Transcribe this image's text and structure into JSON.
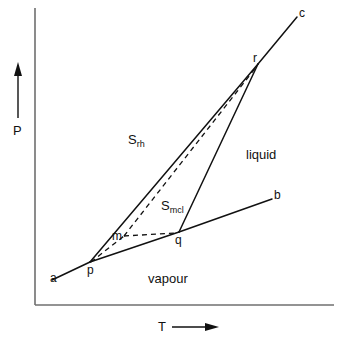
{
  "figure": {
    "background_color": "#ffffff",
    "line_color": "#111111",
    "axes": {
      "y_label": "P",
      "y_arrow": "up-arrow",
      "x_label": "T",
      "x_arrow": "right-arrow",
      "x_axis_name": "temperature-axis",
      "y_axis_name": "pressure-axis"
    }
  },
  "regions": [
    {
      "id": "s_rh",
      "label_main": "S",
      "label_sub": "rh",
      "x": 128,
      "y": 133
    },
    {
      "id": "s_mcl",
      "label_main": "S",
      "label_sub": "mcl",
      "x": 161,
      "y": 199
    },
    {
      "id": "liquid",
      "label_main": "liquid",
      "label_sub": "",
      "x": 246,
      "y": 148
    },
    {
      "id": "vapour",
      "label_main": "vapour",
      "label_sub": "",
      "x": 148,
      "y": 272
    }
  ],
  "points": [
    {
      "id": "a",
      "label": "a",
      "x": 52,
      "y": 280,
      "label_x": 50,
      "label_y": 272
    },
    {
      "id": "b",
      "label": "b",
      "x": 272,
      "y": 199,
      "label_x": 274,
      "label_y": 189
    },
    {
      "id": "c",
      "label": "c",
      "x": 297,
      "y": 17,
      "label_x": 299,
      "label_y": 7
    },
    {
      "id": "p",
      "label": "p",
      "x": 90,
      "y": 262,
      "label_x": 87,
      "label_y": 264
    },
    {
      "id": "q",
      "label": "q",
      "x": 179,
      "y": 232,
      "label_x": 175,
      "label_y": 234
    },
    {
      "id": "r",
      "label": "r",
      "x": 258,
      "y": 64,
      "label_x": 253,
      "label_y": 52
    },
    {
      "id": "m",
      "label": "m",
      "x": 118,
      "y": 233,
      "label_x": 112,
      "label_y": 230
    }
  ],
  "curves": [
    {
      "id": "sublimation-ap",
      "style": "solid",
      "from": "a",
      "to": "p"
    },
    {
      "id": "sublimation-pq",
      "style": "solid",
      "from": "p",
      "to": "q"
    },
    {
      "id": "vaporization-qb",
      "style": "solid",
      "from": "q",
      "to": "b"
    },
    {
      "id": "transition-pr",
      "style": "solid",
      "from": "p",
      "to": "r"
    },
    {
      "id": "fusion-qr",
      "style": "solid",
      "from": "q",
      "to": "r"
    },
    {
      "id": "fusion-rc",
      "style": "solid",
      "from": "r",
      "to": "c"
    },
    {
      "id": "metastable-pm",
      "style": "dashed",
      "from": "p",
      "to": "m"
    },
    {
      "id": "metastable-mq",
      "style": "dashed",
      "from": "m",
      "to": "q"
    },
    {
      "id": "metastable-mr",
      "style": "dashed",
      "from": "m",
      "to": "r"
    }
  ]
}
